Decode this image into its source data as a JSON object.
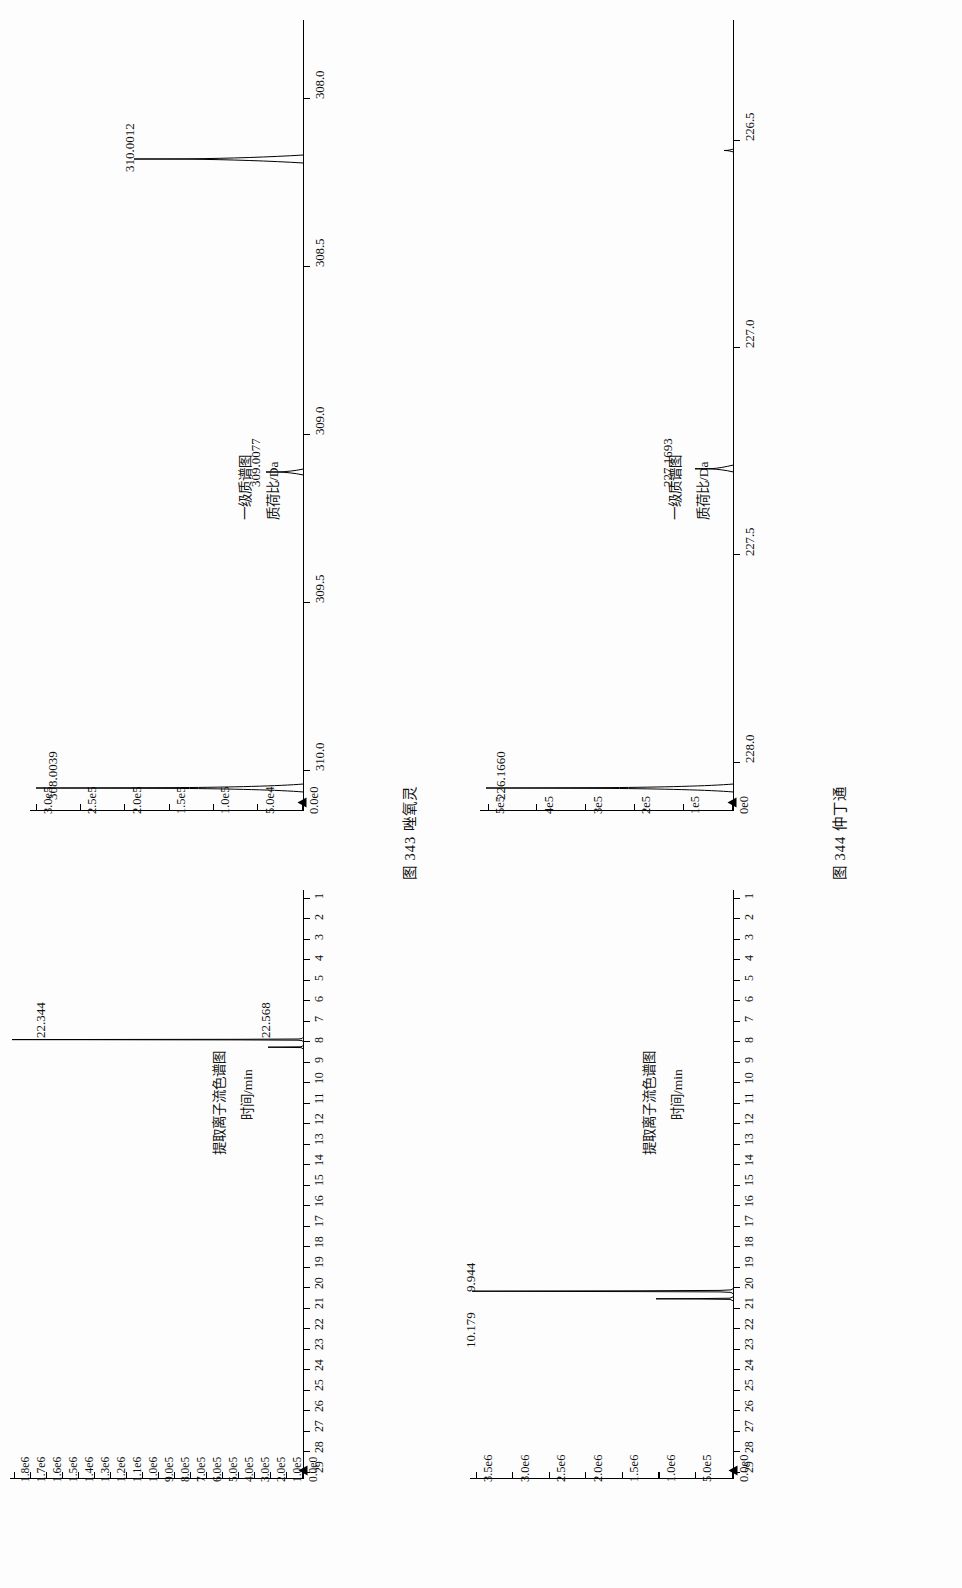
{
  "page": {
    "background": "#fdfdfd",
    "ink": "#111111"
  },
  "figures": [
    {
      "id": "fig-343",
      "caption": "图 343  唑氧灵",
      "caption_number": "图 343",
      "caption_name": "唑氧灵",
      "panels": [
        {
          "id": "fig343-eic",
          "kind": "chromatogram",
          "xlabel": "时间/min",
          "title": "提取离子流色谱图",
          "xticklabels": [
            "1",
            "2",
            "3",
            "4",
            "5",
            "6",
            "7",
            "8",
            "9",
            "10",
            "11",
            "12",
            "13",
            "14",
            "15",
            "16",
            "17",
            "18",
            "19",
            "20",
            "21",
            "22",
            "23",
            "24",
            "25",
            "26",
            "27",
            "28",
            "29"
          ],
          "yticklabels": [
            "0.0e0",
            "1.0e5",
            "2.0e5",
            "3.0e5",
            "4.0e5",
            "5.0e5",
            "6.0e5",
            "7.0e5",
            "8.0e5",
            "9.0e5",
            "1.0e6",
            "1.1e6",
            "1.2e6",
            "1.3e6",
            "1.4e6",
            "1.5e6",
            "1.6e6",
            "1.7e6",
            "1.8e6"
          ],
          "peaks": [
            {
              "label": "22.344",
              "x": 22.344,
              "height": 1.0
            },
            {
              "label": "22.568",
              "x": 22.568,
              "height": 0.12
            }
          ]
        },
        {
          "id": "fig343-ms",
          "kind": "mass-spectrum",
          "xlabel": "质荷比/Da",
          "title": "一级质谱图",
          "xticklabels": [
            "308.0",
            "308.5",
            "309.0",
            "309.5",
            "310.0"
          ],
          "yticklabels": [
            "0.0e0",
            "5.0e4",
            "1.0e5",
            "1.5e5",
            "2.0e5",
            "2.5e5",
            "3.0e5"
          ],
          "peaks": [
            {
              "label": "308.0039",
              "mz": 308.0039,
              "height": 1.0
            },
            {
              "label": "309.0077",
              "mz": 309.0077,
              "height": 0.13
            },
            {
              "label": "310.0012",
              "mz": 310.0012,
              "height": 0.62
            }
          ]
        }
      ]
    },
    {
      "id": "fig-344",
      "caption": "图 344  仲丁通",
      "caption_number": "图 344",
      "caption_name": "仲丁通",
      "panels": [
        {
          "id": "fig344-eic",
          "kind": "chromatogram",
          "xlabel": "时间/min",
          "title": "提取离子流色谱图",
          "xticklabels": [
            "1",
            "2",
            "3",
            "4",
            "5",
            "6",
            "7",
            "8",
            "9",
            "10",
            "11",
            "12",
            "13",
            "14",
            "15",
            "16",
            "17",
            "18",
            "19",
            "20",
            "21",
            "22",
            "23",
            "24",
            "25",
            "26",
            "27",
            "28",
            "29"
          ],
          "yticklabels": [
            "0.0e0",
            "5.0e5",
            "1.0e6",
            "1.5e6",
            "2.0e6",
            "2.5e6",
            "3.0e6",
            "3.5e6"
          ],
          "peaks": [
            {
              "label": "9.944",
              "x": 9.944,
              "height": 1.0
            },
            {
              "label": "10.179",
              "x": 10.179,
              "height": 0.3
            }
          ]
        },
        {
          "id": "fig344-ms",
          "kind": "mass-spectrum",
          "xlabel": "质荷比/Da",
          "title": "一级质谱图",
          "xticklabels": [
            "226.5",
            "227.0",
            "227.5",
            "228.0"
          ],
          "yticklabels": [
            "0e0",
            "1e5",
            "2e5",
            "3e5",
            "4e5",
            "5e5"
          ],
          "peaks": [
            {
              "label": "226.1660",
              "mz": 226.166,
              "height": 1.0
            },
            {
              "label": "227.1693",
              "mz": 227.1693,
              "height": 0.155
            }
          ]
        }
      ]
    }
  ],
  "chart_data": [
    {
      "type": "line",
      "id": "fig343-eic",
      "title": "提取离子流色谱图",
      "xlabel": "时间/min",
      "ylabel": "",
      "xlim": [
        0.5,
        29.5
      ],
      "ylim": [
        0,
        1800000
      ],
      "xticks": [
        1,
        2,
        3,
        4,
        5,
        6,
        7,
        8,
        9,
        10,
        11,
        12,
        13,
        14,
        15,
        16,
        17,
        18,
        19,
        20,
        21,
        22,
        23,
        24,
        25,
        26,
        27,
        28,
        29
      ],
      "yticks": [
        0,
        100000,
        200000,
        300000,
        400000,
        500000,
        600000,
        700000,
        800000,
        900000,
        1000000,
        1100000,
        1200000,
        1300000,
        1400000,
        1500000,
        1600000,
        1700000,
        1800000
      ],
      "yticklabels": [
        "0.0e0",
        "1.0e5",
        "2.0e5",
        "3.0e5",
        "4.0e5",
        "5.0e5",
        "6.0e5",
        "7.0e5",
        "8.0e5",
        "9.0e5",
        "1.0e6",
        "1.1e6",
        "1.2e6",
        "1.3e6",
        "1.4e6",
        "1.5e6",
        "1.6e6",
        "1.7e6",
        "1.8e6"
      ],
      "grid": false,
      "legend": "none",
      "annotations": [
        {
          "text": "22.344",
          "x": 22.344,
          "y": 1800000
        },
        {
          "text": "22.568",
          "x": 22.568,
          "y": 215000
        }
      ],
      "series": [
        {
          "name": "EIC m/z 308.0039",
          "x": [
            22.344,
            22.568
          ],
          "values": [
            1800000,
            215000
          ]
        }
      ]
    },
    {
      "type": "line",
      "id": "fig343-ms",
      "title": "一级质谱图",
      "xlabel": "质荷比/Da",
      "ylabel": "",
      "xlim": [
        307.85,
        310.15
      ],
      "ylim": [
        0,
        300000
      ],
      "xticks": [
        308.0,
        308.5,
        309.0,
        309.5,
        310.0
      ],
      "yticks": [
        0,
        50000,
        100000,
        150000,
        200000,
        250000,
        300000
      ],
      "yticklabels": [
        "0.0e0",
        "5.0e4",
        "1.0e5",
        "1.5e5",
        "2.0e5",
        "2.5e5",
        "3.0e5"
      ],
      "grid": false,
      "legend": "none",
      "annotations": [
        {
          "text": "308.0039",
          "x": 308.0039,
          "y": 300000
        },
        {
          "text": "309.0077",
          "x": 309.0077,
          "y": 40000
        },
        {
          "text": "310.0012",
          "x": 310.0012,
          "y": 186000
        }
      ],
      "series": [
        {
          "name": "MS1",
          "x": [
            308.0039,
            309.0077,
            310.0012
          ],
          "values": [
            300000,
            40000,
            186000
          ]
        }
      ]
    },
    {
      "type": "line",
      "id": "fig344-eic",
      "title": "提取离子流色谱图",
      "xlabel": "时间/min",
      "ylabel": "",
      "xlim": [
        0.5,
        29.5
      ],
      "ylim": [
        0,
        3500000
      ],
      "xticks": [
        1,
        2,
        3,
        4,
        5,
        6,
        7,
        8,
        9,
        10,
        11,
        12,
        13,
        14,
        15,
        16,
        17,
        18,
        19,
        20,
        21,
        22,
        23,
        24,
        25,
        26,
        27,
        28,
        29
      ],
      "yticks": [
        0,
        500000,
        1000000,
        1500000,
        2000000,
        2500000,
        3000000,
        3500000
      ],
      "yticklabels": [
        "0.0e0",
        "5.0e5",
        "1.0e6",
        "1.5e6",
        "2.0e6",
        "2.5e6",
        "3.0e6",
        "3.5e6"
      ],
      "grid": false,
      "legend": "none",
      "annotations": [
        {
          "text": "9.944",
          "x": 9.944,
          "y": 3500000
        },
        {
          "text": "10.179",
          "x": 10.179,
          "y": 1050000
        }
      ],
      "series": [
        {
          "name": "EIC m/z 226.1660",
          "x": [
            9.944,
            10.179
          ],
          "values": [
            3500000,
            1050000
          ]
        }
      ]
    },
    {
      "type": "line",
      "id": "fig344-ms",
      "title": "一级质谱图",
      "xlabel": "质荷比/Da",
      "ylabel": "",
      "xlim": [
        226.1,
        228.2
      ],
      "ylim": [
        0,
        550000
      ],
      "xticks": [
        226.5,
        227.0,
        227.5,
        228.0
      ],
      "yticks": [
        0,
        100000,
        200000,
        300000,
        400000,
        500000
      ],
      "yticklabels": [
        "0e0",
        "1e5",
        "2e5",
        "3e5",
        "4e5",
        "5e5"
      ],
      "grid": false,
      "legend": "none",
      "annotations": [
        {
          "text": "226.1660",
          "x": 226.166,
          "y": 550000
        },
        {
          "text": "227.1693",
          "x": 227.1693,
          "y": 85000
        }
      ],
      "series": [
        {
          "name": "MS1",
          "x": [
            226.166,
            227.1693
          ],
          "values": [
            550000,
            85000
          ]
        }
      ]
    }
  ]
}
